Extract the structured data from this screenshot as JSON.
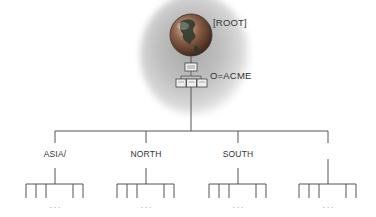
{
  "diagram": {
    "root": {
      "label": "[ROOT]",
      "icon": "globe-icon"
    },
    "organization": {
      "label": "O=ACME",
      "icon": "server-hierarchy-icon"
    },
    "branches": [
      {
        "label": "ASIA/",
        "x": 55
      },
      {
        "label": "NORTH",
        "x": 146
      },
      {
        "label": "SOUTH",
        "x": 238
      },
      {
        "label": "",
        "x": 328
      }
    ],
    "ellipsis": "..."
  },
  "colors": {
    "line": "#555555",
    "text": "#333333",
    "halo": "#b0b0b0",
    "globe_ocean": "#6b4a3a",
    "globe_land": "#2f3b2f"
  }
}
